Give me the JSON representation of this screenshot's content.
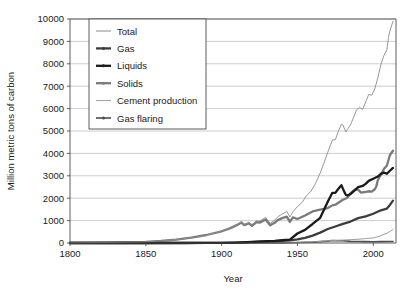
{
  "chart_data": {
    "type": "line",
    "title": "",
    "xlabel": "Year",
    "ylabel": "Million metric tons of carbon",
    "xlim": [
      1800,
      2015
    ],
    "ylim": [
      0,
      10000
    ],
    "xticks": [
      1800,
      1850,
      1900,
      1950,
      2000
    ],
    "yticks": [
      0,
      1000,
      2000,
      3000,
      4000,
      5000,
      6000,
      7000,
      8000,
      9000,
      10000
    ],
    "grid": "horizontal",
    "legend_position": "top-left-inside",
    "series": [
      {
        "name": "Total",
        "color": "#8c8c8c",
        "width": 0.9,
        "x": [
          1800,
          1810,
          1820,
          1830,
          1840,
          1850,
          1860,
          1870,
          1875,
          1880,
          1885,
          1890,
          1895,
          1900,
          1905,
          1910,
          1913,
          1915,
          1918,
          1920,
          1923,
          1925,
          1929,
          1932,
          1935,
          1937,
          1940,
          1943,
          1945,
          1947,
          1950,
          1953,
          1956,
          1959,
          1962,
          1965,
          1968,
          1970,
          1973,
          1975,
          1977,
          1979,
          1980,
          1982,
          1983,
          1985,
          1987,
          1989,
          1991,
          1993,
          1995,
          1997,
          1999,
          2001,
          2003,
          2005,
          2007,
          2009,
          2010,
          2011,
          2013
        ],
        "y": [
          8,
          12,
          17,
          24,
          38,
          54,
          91,
          147,
          187,
          236,
          290,
          357,
          428,
          534,
          654,
          819,
          943,
          832,
          917,
          816,
          986,
          975,
          1145,
          878,
          1022,
          1168,
          1299,
          1409,
          1160,
          1389,
          1630,
          1803,
          2114,
          2317,
          2672,
          3122,
          3667,
          4053,
          4596,
          4615,
          4987,
          5304,
          5261,
          4960,
          5073,
          5275,
          5601,
          5948,
          6050,
          5963,
          6293,
          6628,
          6600,
          6877,
          7371,
          7963,
          8361,
          8620,
          9167,
          9470,
          9900
        ]
      },
      {
        "name": "Gas",
        "color": "#3d3d3d",
        "width": 2.3,
        "x": [
          1800,
          1850,
          1885,
          1900,
          1910,
          1920,
          1930,
          1940,
          1945,
          1950,
          1955,
          1960,
          1965,
          1970,
          1975,
          1980,
          1985,
          1990,
          1995,
          2000,
          2005,
          2009,
          2011,
          2013
        ],
        "y": [
          0,
          0,
          2,
          9,
          17,
          35,
          67,
          96,
          117,
          160,
          232,
          328,
          463,
          625,
          738,
          856,
          958,
          1110,
          1190,
          1306,
          1460,
          1539,
          1700,
          1890
        ]
      },
      {
        "name": "Liquids",
        "color": "#1a1a1a",
        "width": 2.3,
        "x": [
          1800,
          1860,
          1875,
          1890,
          1900,
          1910,
          1920,
          1930,
          1935,
          1940,
          1945,
          1950,
          1955,
          1960,
          1965,
          1970,
          1973,
          1975,
          1977,
          1979,
          1980,
          1981,
          1982,
          1983,
          1985,
          1987,
          1990,
          1993,
          1995,
          1997,
          2000,
          2003,
          2005,
          2007,
          2009,
          2011,
          2013
        ],
        "y": [
          0,
          0,
          1,
          4,
          9,
          20,
          46,
          83,
          94,
          126,
          155,
          423,
          587,
          849,
          1125,
          1838,
          2240,
          2237,
          2420,
          2582,
          2420,
          2270,
          2140,
          2120,
          2186,
          2300,
          2492,
          2547,
          2639,
          2772,
          2869,
          2968,
          3085,
          3140,
          3090,
          3225,
          3350
        ]
      },
      {
        "name": "Solids",
        "color": "#7a7a7a",
        "width": 2.3,
        "x": [
          1800,
          1820,
          1840,
          1850,
          1860,
          1870,
          1880,
          1890,
          1900,
          1905,
          1910,
          1913,
          1915,
          1918,
          1920,
          1923,
          1925,
          1929,
          1932,
          1935,
          1937,
          1940,
          1943,
          1945,
          1947,
          1950,
          1955,
          1960,
          1965,
          1970,
          1973,
          1975,
          1978,
          1980,
          1983,
          1985,
          1988,
          1990,
          1992,
          1995,
          1997,
          1999,
          2001,
          2002,
          2003,
          2005,
          2007,
          2009,
          2011,
          2013
        ],
        "y": [
          8,
          17,
          38,
          54,
          91,
          147,
          236,
          357,
          524,
          640,
          797,
          915,
          800,
          880,
          770,
          930,
          910,
          1050,
          790,
          900,
          1020,
          1110,
          1180,
          940,
          1140,
          1070,
          1230,
          1410,
          1490,
          1560,
          1680,
          1710,
          1840,
          1930,
          2020,
          2230,
          2390,
          2380,
          2250,
          2280,
          2310,
          2290,
          2400,
          2520,
          2800,
          3050,
          3300,
          3460,
          3930,
          4120
        ]
      },
      {
        "name": "Cement production",
        "color": "#9e9e9e",
        "width": 1.0,
        "x": [
          1800,
          1900,
          1920,
          1940,
          1950,
          1960,
          1970,
          1980,
          1990,
          1995,
          2000,
          2003,
          2005,
          2007,
          2009,
          2011,
          2013
        ],
        "y": [
          0,
          1,
          4,
          9,
          18,
          43,
          95,
          131,
          166,
          198,
          226,
          277,
          330,
          385,
          430,
          517,
          600
        ]
      },
      {
        "name": "Gas flaring",
        "color": "#4d4d4d",
        "width": 1.6,
        "x": [
          1800,
          1900,
          1920,
          1940,
          1950,
          1960,
          1970,
          1973,
          1980,
          1985,
          1990,
          1995,
          2000,
          2005,
          2010,
          2013
        ],
        "y": [
          0,
          0,
          2,
          7,
          23,
          40,
          82,
          110,
          98,
          73,
          65,
          60,
          58,
          62,
          70,
          70
        ]
      }
    ],
    "legend_entries": [
      {
        "label": "Total",
        "marker": "line"
      },
      {
        "label": "Gas",
        "marker": "line-dot"
      },
      {
        "label": "Liquids",
        "marker": "line-dot"
      },
      {
        "label": "Solids",
        "marker": "line-dot"
      },
      {
        "label": "Cement production",
        "marker": "line"
      },
      {
        "label": "Gas flaring",
        "marker": "line-dot"
      }
    ]
  }
}
